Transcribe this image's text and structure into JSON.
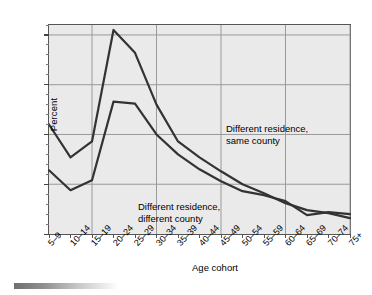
{
  "chart_data": {
    "type": "line",
    "title": "",
    "xlabel": "Age cohort",
    "ylabel": "Percent",
    "categories": [
      "5–9",
      "10–14",
      "15–19",
      "20–24",
      "25–29",
      "30–34",
      "35–39",
      "40–44",
      "45–49",
      "50–54",
      "55–59",
      "60–64",
      "65–69",
      "70–74",
      "75+"
    ],
    "ylim": [
      0,
      21
    ],
    "yticks": [
      0,
      5,
      10,
      15,
      20
    ],
    "ytick_labels": [
      "0",
      "5",
      "10",
      "15",
      "20"
    ],
    "grid": "major-horizontal-and-every-third-vertical",
    "legend": "inline-annotations",
    "series": [
      {
        "name": "Different residence, same county",
        "color": "#333333",
        "values": [
          11.0,
          7.7,
          9.3,
          20.5,
          18.2,
          13.0,
          9.3,
          7.7,
          6.3,
          5.0,
          4.1,
          3.1,
          2.4,
          2.1,
          1.6
        ]
      },
      {
        "name": "Different residence, different county",
        "color": "#333333",
        "values": [
          6.4,
          4.4,
          5.4,
          13.3,
          13.1,
          10.0,
          8.0,
          6.5,
          5.3,
          4.3,
          3.9,
          3.3,
          1.9,
          2.2,
          2.0
        ]
      }
    ],
    "annotations": [
      {
        "id": "same-county",
        "text": "Different residence,\nsame county"
      },
      {
        "id": "different-county",
        "text": "Different residence,\ndifferent county"
      }
    ]
  },
  "figure": {
    "background_color": "#ffffff",
    "plot_background_color": "#eaeaea",
    "axis_color": "#555555",
    "gridline_color": "#9a9a9a",
    "line_color": "#333333"
  }
}
